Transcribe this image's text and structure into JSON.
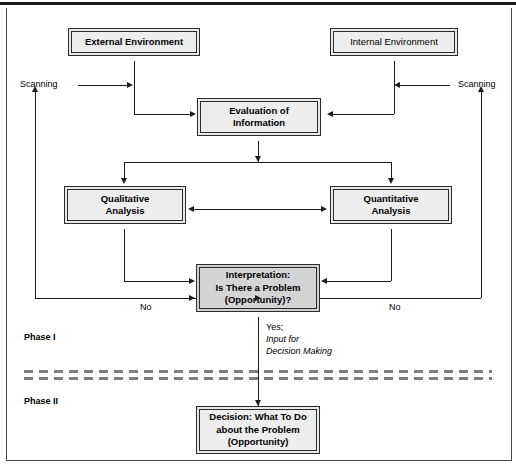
{
  "boxes": {
    "external_environment": "External Environment",
    "internal_environment": "Internal Environment",
    "evaluation_line1": "Evaluation of",
    "evaluation_line2": "Information",
    "qualitative_line1": "Qualitative",
    "qualitative_line2": "Analysis",
    "quantitative_line1": "Quantitative",
    "quantitative_line2": "Analysis",
    "interpretation_line1": "Interpretation:",
    "interpretation_line2": "Is There a Problem",
    "interpretation_line3": "(Opportunity)?",
    "decision_line1": "Decision: What To Do",
    "decision_line2": "about the Problem",
    "decision_line3": "(Opportunity)"
  },
  "labels": {
    "scanning_left": "Scanning",
    "scanning_right": "Scanning",
    "no_left": "No",
    "no_right": "No",
    "yes": "Yes;",
    "input_for": "Input for",
    "decision_making": "Decision Making",
    "phase_one": "Phase I",
    "phase_two": "Phase II"
  },
  "colors": {
    "line": "#1d1d1d",
    "box_fill": "#ededed",
    "box_fill_dark": "#d4d4d4",
    "shadow": "#111111",
    "divider": "#7d7d7d"
  }
}
